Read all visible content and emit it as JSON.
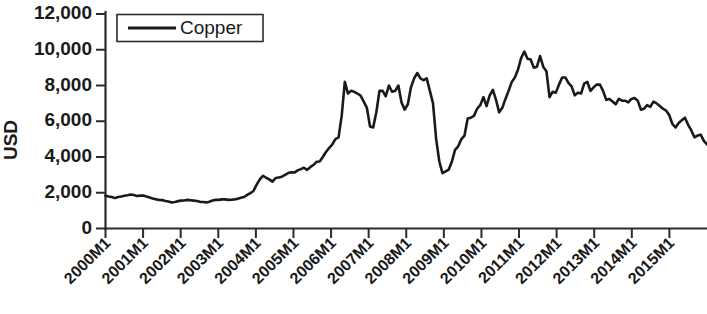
{
  "chart_data": {
    "type": "line",
    "title": "",
    "xlabel": "",
    "ylabel": "USD",
    "ylim": [
      0,
      12000
    ],
    "grid": false,
    "legend_position": "top-left",
    "y_ticks": [
      "0",
      "2,000",
      "4,000",
      "6,000",
      "8,000",
      "10,000",
      "12,000"
    ],
    "y_tick_values": [
      0,
      2000,
      4000,
      6000,
      8000,
      10000,
      12000
    ],
    "x_ticks": [
      "2000M1",
      "2001M1",
      "2002M1",
      "2003M1",
      "2004M1",
      "2005M1",
      "2006M1",
      "2007M1",
      "2008M1",
      "2009M1",
      "2010M1",
      "2011M1",
      "2012M1",
      "2013M1",
      "2014M1",
      "2015M1"
    ],
    "series": [
      {
        "name": "Copper",
        "color": "#1a1a1a",
        "x_start": "2000M1",
        "x_end": "2015M12",
        "values": [
          1830,
          1790,
          1760,
          1700,
          1760,
          1790,
          1830,
          1860,
          1900,
          1870,
          1820,
          1840,
          1840,
          1790,
          1740,
          1680,
          1630,
          1600,
          1590,
          1540,
          1510,
          1450,
          1480,
          1530,
          1560,
          1570,
          1600,
          1580,
          1560,
          1540,
          1490,
          1480,
          1460,
          1500,
          1570,
          1600,
          1600,
          1630,
          1630,
          1600,
          1610,
          1630,
          1670,
          1720,
          1760,
          1880,
          1980,
          2100,
          2450,
          2750,
          2950,
          2840,
          2750,
          2620,
          2820,
          2850,
          2900,
          3000,
          3100,
          3150,
          3130,
          3250,
          3320,
          3400,
          3280,
          3430,
          3550,
          3730,
          3750,
          4000,
          4280,
          4500,
          4700,
          5000,
          5100,
          6300,
          8200,
          7550,
          7700,
          7650,
          7550,
          7430,
          7100,
          6750,
          5700,
          5650,
          6500,
          7700,
          7700,
          7400,
          8000,
          7650,
          7700,
          8000,
          7050,
          6650,
          6950,
          7900,
          8400,
          8700,
          8400,
          8300,
          8400,
          7700,
          7000,
          5000,
          3750,
          3100,
          3200,
          3300,
          3750,
          4400,
          4600,
          5000,
          5200,
          6150,
          6200,
          6300,
          6700,
          6900,
          7350,
          6850,
          7450,
          7750,
          7200,
          6500,
          6750,
          7250,
          7700,
          8200,
          8450,
          8900,
          9550,
          9900,
          9500,
          9450,
          9000,
          9050,
          9650,
          9050,
          8800,
          7350,
          7650,
          7600,
          8050,
          8450,
          8450,
          8150,
          7950,
          7450,
          7600,
          7550,
          8100,
          8200,
          7700,
          7900,
          8050,
          8050,
          7700,
          7200,
          7250,
          7100,
          6950,
          7250,
          7150,
          7150,
          7050,
          7250,
          7300,
          7150,
          6650,
          6700,
          6900,
          6800,
          7100,
          7000,
          6850,
          6700,
          6600,
          6350,
          5850,
          5650,
          5900,
          6050,
          6200,
          5800,
          5500,
          5100,
          5200,
          5250,
          4900,
          4700
        ]
      }
    ],
    "annotations": []
  },
  "legend": {
    "entries": [
      {
        "label": "Copper"
      }
    ]
  }
}
